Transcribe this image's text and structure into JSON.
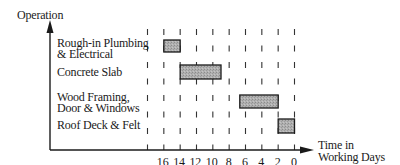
{
  "chart_data": {
    "type": "bar",
    "subtype": "gantt",
    "title": "",
    "ylabel": "Operation",
    "xlabel": "Time in Working Days",
    "xlabel_lines": [
      "Time in",
      "Working Days"
    ],
    "x_axis_reversed": true,
    "xlim": [
      18,
      0
    ],
    "x_ticks": [
      16,
      14,
      12,
      10,
      8,
      6,
      4,
      2,
      0
    ],
    "grid": "vertical dashed lines every 2 days",
    "legend": null,
    "categories": [
      "Rough-in Plumbing & Electrical",
      "Concrete Slab",
      "Wood Framing, Door & Windows",
      "Roof Deck & Felt"
    ],
    "category_lines": [
      [
        "Rough-in Plumbing",
        "& Electrical"
      ],
      [
        "Concrete Slab"
      ],
      [
        "Wood Framing,",
        "Door & Windows"
      ],
      [
        "Roof Deck & Felt"
      ]
    ],
    "series": [
      {
        "name": "Activity duration (days remaining)",
        "bars": [
          {
            "category": "Rough-in Plumbing & Electrical",
            "start": 16,
            "end": 14
          },
          {
            "category": "Concrete Slab",
            "start": 14,
            "end": 9
          },
          {
            "category": "Wood Framing, Door & Windows",
            "start": 6.7,
            "end": 2
          },
          {
            "category": "Roof Deck & Felt",
            "start": 2,
            "end": 0
          }
        ]
      }
    ],
    "colors": {
      "bar_fill": "#a9a9a9",
      "bar_stroke": "#1a1a1a",
      "axis": "#1a1a1a",
      "grid": "#333333"
    }
  }
}
